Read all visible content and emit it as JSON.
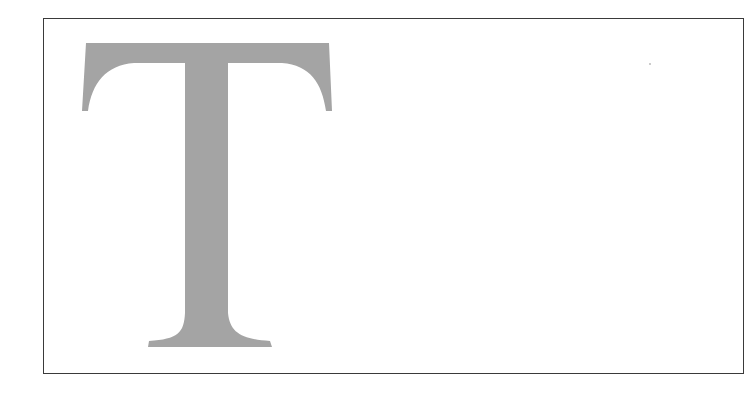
{
  "figure": {
    "glyph": "T",
    "glyph_color": "#a4a4a4",
    "frame_color": "#3a3a3a",
    "background": "#ffffff"
  }
}
